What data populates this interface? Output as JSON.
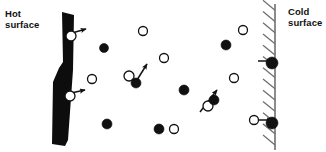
{
  "figure": {
    "type": "diagram",
    "width": 326,
    "height": 152,
    "background": "#ffffff"
  },
  "labels": {
    "hot_surface": "Hot\nsurface",
    "cold_surface": "Cold\nsurface"
  },
  "colors": {
    "ink": "#111111",
    "wall_hot_fill": "#0d0d0d",
    "wall_cold_stroke": "#6f6f6f",
    "molecule_fast_fill": "#111111",
    "molecule_slow_fill": "#ffffff",
    "molecule_stroke": "#111111"
  },
  "hot_wall": {
    "name": "hot-surface-wall",
    "style": "solid-black-slab",
    "x_top": 62,
    "x_bottom": 52,
    "y_top": 12,
    "y_bottom": 146,
    "thickness_top": 12,
    "thickness_bottom": 16
  },
  "cold_wall": {
    "name": "cold-surface-wall",
    "style": "hatched-line",
    "x": 275,
    "y_top": 4,
    "y_bottom": 150,
    "hatch_count": 13,
    "hatch_direction": "up-right",
    "hatch_length": 12
  },
  "molecules": [
    {
      "id": 1,
      "type": "slow",
      "fill": "open",
      "cx": 71,
      "cy": 36,
      "r": 5
    },
    {
      "id": 2,
      "type": "slow",
      "fill": "open",
      "cx": 70,
      "cy": 96,
      "r": 5
    },
    {
      "id": 3,
      "type": "fast",
      "fill": "filled",
      "cx": 104,
      "cy": 48,
      "r": 4.5
    },
    {
      "id": 4,
      "type": "slow",
      "fill": "open",
      "cx": 92,
      "cy": 79,
      "r": 4.5
    },
    {
      "id": 5,
      "type": "slow",
      "fill": "open",
      "cx": 143,
      "cy": 31,
      "r": 4.5
    },
    {
      "id": 6,
      "type": "slow",
      "fill": "open",
      "cx": 164,
      "cy": 58,
      "r": 4.5
    },
    {
      "id": 7,
      "type": "slow",
      "fill": "open",
      "cx": 129,
      "cy": 76,
      "r": 5
    },
    {
      "id": 8,
      "type": "fast",
      "fill": "filled",
      "cx": 136,
      "cy": 83,
      "r": 5
    },
    {
      "id": 9,
      "type": "fast",
      "fill": "filled",
      "cx": 184,
      "cy": 90,
      "r": 5
    },
    {
      "id": 10,
      "type": "fast",
      "fill": "filled",
      "cx": 107,
      "cy": 124,
      "r": 5
    },
    {
      "id": 11,
      "type": "fast",
      "fill": "filled",
      "cx": 159,
      "cy": 129,
      "r": 5
    },
    {
      "id": 12,
      "type": "slow",
      "fill": "open",
      "cx": 174,
      "cy": 129,
      "r": 4.5
    },
    {
      "id": 13,
      "type": "fast",
      "fill": "filled",
      "cx": 226,
      "cy": 45,
      "r": 5
    },
    {
      "id": 14,
      "type": "slow",
      "fill": "open",
      "cx": 243,
      "cy": 30,
      "r": 4.5
    },
    {
      "id": 15,
      "type": "slow",
      "fill": "open",
      "cx": 234,
      "cy": 78,
      "r": 4.5
    },
    {
      "id": 16,
      "type": "slow",
      "fill": "open",
      "cx": 208,
      "cy": 106,
      "r": 5
    },
    {
      "id": 17,
      "type": "fast",
      "fill": "filled",
      "cx": 214,
      "cy": 100,
      "r": 5
    },
    {
      "id": 18,
      "type": "slow",
      "fill": "open",
      "cx": 254,
      "cy": 120,
      "r": 4.5
    },
    {
      "id": 19,
      "type": "fast",
      "fill": "filled",
      "cx": 272,
      "cy": 63,
      "r": 6
    },
    {
      "id": 20,
      "type": "fast",
      "fill": "filled",
      "cx": 272,
      "cy": 123,
      "r": 6
    }
  ],
  "velocity_arrows": [
    {
      "id": "a1",
      "from_molecule": 1,
      "x1": 72,
      "y1": 33,
      "x2": 86,
      "y2": 29,
      "direction": "right-up",
      "note": "leaving hot surface"
    },
    {
      "id": "a2",
      "from_molecule": 2,
      "x1": 71,
      "y1": 93,
      "x2": 85,
      "y2": 90,
      "direction": "right-up",
      "note": "leaving hot surface"
    },
    {
      "id": "a3",
      "from_molecule": 8,
      "x1": 137,
      "y1": 80,
      "x2": 147,
      "y2": 64,
      "direction": "up-right",
      "note": "mid-gas collision recoil"
    },
    {
      "id": "a4",
      "from_molecule": 17,
      "x1": 200,
      "y1": 112,
      "x2": 217,
      "y2": 90,
      "direction": "up-right",
      "note": "mid-gas collision recoil"
    },
    {
      "id": "a5",
      "from_molecule": 19,
      "x1": 258,
      "y1": 61,
      "x2": 272,
      "y2": 61,
      "direction": "right",
      "note": "striking cold surface"
    },
    {
      "id": "a6",
      "from_molecule": 20,
      "x1": 259,
      "y1": 120,
      "x2": 272,
      "y2": 120,
      "direction": "right",
      "note": "striking cold surface"
    }
  ],
  "legend_semantics": {
    "filled_circle": "higher-energy (hot) molecule",
    "open_circle": "lower-energy (cold) molecule",
    "arrow": "molecule velocity vector"
  }
}
